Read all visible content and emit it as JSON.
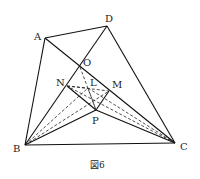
{
  "figure": {
    "caption": "図6",
    "points": {
      "A": {
        "label": "A",
        "x": 45,
        "y": 38,
        "lx": 34,
        "ly": 40
      },
      "D": {
        "label": "D",
        "x": 107,
        "y": 26,
        "lx": 105,
        "ly": 22
      },
      "B": {
        "label": "B",
        "x": 25,
        "y": 145,
        "lx": 13,
        "ly": 152
      },
      "C": {
        "label": "C",
        "x": 175,
        "y": 143,
        "lx": 180,
        "ly": 150
      },
      "O": {
        "label": "O",
        "x": 80,
        "y": 67,
        "lx": 83,
        "ly": 66
      },
      "N": {
        "label": "N",
        "x": 67,
        "y": 86,
        "lx": 56,
        "ly": 86
      },
      "M": {
        "label": "M",
        "x": 109,
        "y": 91,
        "lx": 112,
        "ly": 88
      },
      "P": {
        "label": "P",
        "x": 96,
        "y": 110,
        "lx": 92,
        "ly": 124
      },
      "L": {
        "label": "L",
        "x": 88,
        "y": 88,
        "lx": 90,
        "ly": 86
      }
    },
    "solid_segments": [
      [
        "A",
        "D"
      ],
      [
        "A",
        "B"
      ],
      [
        "B",
        "C"
      ],
      [
        "D",
        "C"
      ],
      [
        "A",
        "C"
      ],
      [
        "B",
        "D"
      ],
      [
        "B",
        "P"
      ],
      [
        "P",
        "C"
      ],
      [
        "N",
        "P"
      ],
      [
        "M",
        "P"
      ]
    ],
    "dashed_segments": [
      [
        "N",
        "M"
      ],
      [
        "O",
        "P"
      ],
      [
        "B",
        "L"
      ],
      [
        "B",
        "M"
      ],
      [
        "C",
        "L"
      ],
      [
        "C",
        "N"
      ],
      [
        "N",
        "L"
      ],
      [
        "L",
        "P"
      ]
    ]
  }
}
